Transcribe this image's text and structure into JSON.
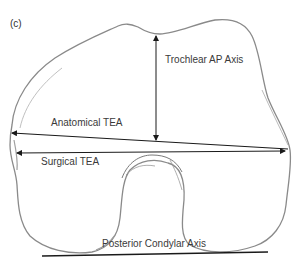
{
  "figure": {
    "panel_label": "(c)",
    "labels": {
      "trochlear_ap_axis": "Trochlear AP Axis",
      "anatomical_tea": "Anatomical TEA",
      "surgical_tea": "Surgical TEA",
      "posterior_condylar_axis": "Posterior Condylar Axis"
    },
    "colors": {
      "outline": "#8a8a8a",
      "axis_line": "#1a1a1a",
      "text": "#3a3a3a",
      "background": "#ffffff"
    }
  }
}
